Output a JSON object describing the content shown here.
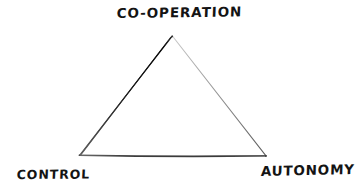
{
  "diagram": {
    "style": "hand-drawn pen sketch",
    "background_color": "#ffffff",
    "ink_color": "#141414",
    "labels": {
      "top": "CO-OPERATION",
      "bottom_left": "CONTROL",
      "bottom_right": "AUTONOMY"
    },
    "shape": {
      "type": "triangle",
      "vertices": {
        "apex": {
          "x": 172,
          "y": 36
        },
        "bottom_left": {
          "x": 79,
          "y": 155
        },
        "bottom_right": {
          "x": 266,
          "y": 156
        }
      },
      "edges": [
        {
          "name": "left-edge",
          "from": "apex",
          "to": "bottom_left",
          "color": "#111111",
          "weight": "thick"
        },
        {
          "name": "right-edge",
          "from": "apex",
          "to": "bottom_right",
          "color": "#9a9a9a",
          "weight": "thin"
        },
        {
          "name": "bottom-edge",
          "from": "bottom_left",
          "to": "bottom_right",
          "color": "#4a4a4a",
          "weight": "medium"
        }
      ]
    }
  }
}
